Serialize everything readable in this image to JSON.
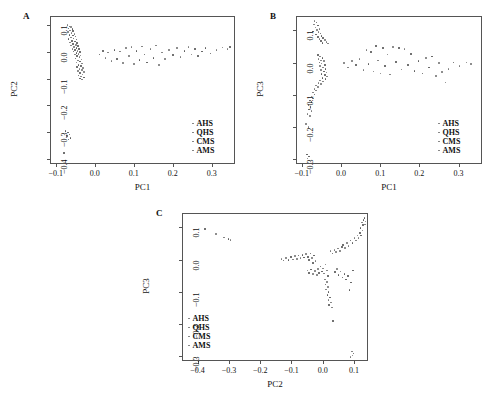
{
  "figure": {
    "background": "#ffffff",
    "point_color": "#777777",
    "frame_color": "#555555"
  },
  "legend_labels": [
    "AHS",
    "QHS",
    "CMS",
    "AMS"
  ],
  "panels": [
    {
      "letter": "A",
      "xlabel": "PC1",
      "ylabel": "PC2",
      "xticks": [
        "-0.1",
        "0.0",
        "0.1",
        "0.2",
        "0.3"
      ],
      "yticks": [
        "0.1",
        "0.0",
        "-0.1",
        "-0.2",
        "-0.3",
        "-0.4"
      ]
    },
    {
      "letter": "B",
      "xlabel": "PC1",
      "ylabel": "PC3",
      "xticks": [
        "-0.1",
        "0.0",
        "0.1",
        "0.2",
        "0.3"
      ],
      "yticks": [
        "0.1",
        "0.0",
        "-0.1",
        "-0.2",
        "-0.3"
      ]
    },
    {
      "letter": "C",
      "xlabel": "PC2",
      "ylabel": "PC3",
      "xticks": [
        "-0.4",
        "-0.3",
        "-0.2",
        "-0.1",
        "0.0",
        "0.1"
      ],
      "yticks": [
        "0.1",
        "0.0",
        "-0.1",
        "-0.2",
        "-0.3"
      ]
    }
  ],
  "chart_data": [
    {
      "type": "scatter",
      "panel": "A",
      "title": "",
      "xlabel": "PC1",
      "ylabel": "PC2",
      "xlim": [
        -0.115,
        0.36
      ],
      "ylim": [
        -0.42,
        0.135
      ],
      "xticks": [
        -0.1,
        0.0,
        0.1,
        0.2,
        0.3
      ],
      "yticks": [
        0.1,
        0.0,
        -0.1,
        -0.2,
        -0.3,
        -0.4
      ],
      "grid": false,
      "legend": [
        "AHS",
        "QHS",
        "CMS",
        "AMS"
      ],
      "legend_position": "lower-right",
      "points": [
        [
          -0.073,
          0.105
        ],
        [
          -0.068,
          0.1
        ],
        [
          -0.063,
          0.098
        ],
        [
          -0.07,
          0.092
        ],
        [
          -0.06,
          0.09
        ],
        [
          -0.066,
          0.085
        ],
        [
          -0.058,
          0.082
        ],
        [
          -0.072,
          0.078
        ],
        [
          -0.062,
          0.075
        ],
        [
          -0.055,
          0.072
        ],
        [
          -0.068,
          0.068
        ],
        [
          -0.059,
          0.065
        ],
        [
          -0.052,
          0.062
        ],
        [
          -0.064,
          0.058
        ],
        [
          -0.057,
          0.055
        ],
        [
          -0.07,
          0.052
        ],
        [
          -0.05,
          0.05
        ],
        [
          -0.061,
          0.046
        ],
        [
          -0.054,
          0.043
        ],
        [
          -0.066,
          0.04
        ],
        [
          -0.048,
          0.038
        ],
        [
          -0.058,
          0.034
        ],
        [
          -0.051,
          0.031
        ],
        [
          -0.063,
          0.028
        ],
        [
          -0.045,
          0.026
        ],
        [
          -0.056,
          0.022
        ],
        [
          -0.049,
          0.019
        ],
        [
          -0.06,
          0.016
        ],
        [
          -0.043,
          0.014
        ],
        [
          -0.053,
          0.011
        ],
        [
          -0.047,
          0.008
        ],
        [
          -0.057,
          0.005
        ],
        [
          -0.041,
          0.003
        ],
        [
          -0.05,
          0.0
        ],
        [
          -0.044,
          -0.003
        ],
        [
          -0.054,
          -0.006
        ],
        [
          -0.039,
          -0.009
        ],
        [
          -0.048,
          -0.012
        ],
        [
          -0.042,
          -0.016
        ],
        [
          -0.052,
          -0.02
        ],
        [
          -0.037,
          -0.024
        ],
        [
          -0.046,
          -0.028
        ],
        [
          -0.04,
          -0.032
        ],
        [
          -0.05,
          -0.036
        ],
        [
          -0.035,
          -0.04
        ],
        [
          -0.044,
          -0.044
        ],
        [
          -0.038,
          -0.048
        ],
        [
          -0.048,
          -0.052
        ],
        [
          -0.033,
          -0.056
        ],
        [
          -0.042,
          -0.06
        ],
        [
          -0.036,
          -0.064
        ],
        [
          -0.046,
          -0.068
        ],
        [
          -0.031,
          -0.072
        ],
        [
          -0.04,
          -0.076
        ],
        [
          -0.034,
          -0.08
        ],
        [
          -0.044,
          -0.084
        ],
        [
          -0.038,
          -0.088
        ],
        [
          -0.03,
          -0.092
        ],
        [
          -0.041,
          -0.096
        ],
        [
          -0.035,
          -0.099
        ],
        [
          0.01,
          -0.005
        ],
        [
          0.018,
          0.008
        ],
        [
          0.025,
          -0.018
        ],
        [
          0.032,
          0.002
        ],
        [
          0.04,
          -0.03
        ],
        [
          0.048,
          0.012
        ],
        [
          0.055,
          -0.022
        ],
        [
          0.062,
          0.005
        ],
        [
          0.07,
          -0.038
        ],
        [
          0.078,
          0.018
        ],
        [
          0.085,
          -0.012
        ],
        [
          0.092,
          0.022
        ],
        [
          0.098,
          -0.042
        ],
        [
          0.105,
          0.008
        ],
        [
          0.112,
          -0.026
        ],
        [
          0.118,
          0.025
        ],
        [
          0.125,
          -0.005
        ],
        [
          0.132,
          -0.035
        ],
        [
          0.14,
          0.015
        ],
        [
          0.148,
          -0.018
        ],
        [
          0.155,
          0.028
        ],
        [
          0.162,
          -0.045
        ],
        [
          0.17,
          0.002
        ],
        [
          0.178,
          -0.022
        ],
        [
          0.188,
          0.012
        ],
        [
          0.198,
          -0.008
        ],
        [
          0.208,
          0.018
        ],
        [
          0.218,
          -0.015
        ],
        [
          0.228,
          0.008
        ],
        [
          0.238,
          0.022
        ],
        [
          0.246,
          -0.005
        ],
        [
          0.254,
          0.015
        ],
        [
          0.262,
          -0.012
        ],
        [
          0.272,
          0.005
        ],
        [
          0.282,
          0.018
        ],
        [
          0.295,
          -0.002
        ],
        [
          0.31,
          0.012
        ],
        [
          0.325,
          0.02
        ],
        [
          0.338,
          0.015
        ],
        [
          0.345,
          0.022
        ],
        [
          -0.078,
          -0.292
        ],
        [
          -0.072,
          -0.298
        ],
        [
          -0.068,
          -0.305
        ],
        [
          -0.074,
          -0.312
        ],
        [
          -0.065,
          -0.318
        ],
        [
          -0.07,
          -0.325
        ],
        [
          -0.082,
          -0.375
        ]
      ]
    },
    {
      "type": "scatter",
      "panel": "B",
      "title": "",
      "xlabel": "PC1",
      "ylabel": "PC3",
      "xlim": [
        -0.115,
        0.36
      ],
      "ylim": [
        -0.315,
        0.145
      ],
      "xticks": [
        -0.1,
        0.0,
        0.1,
        0.2,
        0.3
      ],
      "yticks": [
        0.1,
        0.0,
        -0.1,
        -0.2,
        -0.3
      ],
      "grid": false,
      "legend": [
        "AHS",
        "QHS",
        "CMS",
        "AMS"
      ],
      "legend_position": "lower-right",
      "points": [
        [
          -0.07,
          0.132
        ],
        [
          -0.065,
          0.128
        ],
        [
          -0.072,
          0.122
        ],
        [
          -0.062,
          0.118
        ],
        [
          -0.068,
          0.112
        ],
        [
          -0.058,
          0.108
        ],
        [
          -0.064,
          0.104
        ],
        [
          -0.074,
          0.1
        ],
        [
          -0.06,
          0.098
        ],
        [
          -0.055,
          0.094
        ],
        [
          -0.066,
          0.09
        ],
        [
          -0.052,
          0.086
        ],
        [
          -0.062,
          0.082
        ],
        [
          -0.048,
          0.08
        ],
        [
          -0.058,
          0.076
        ],
        [
          -0.044,
          0.074
        ],
        [
          -0.054,
          0.07
        ],
        [
          -0.04,
          0.068
        ],
        [
          -0.05,
          0.064
        ],
        [
          -0.036,
          0.062
        ],
        [
          -0.062,
          0.026
        ],
        [
          -0.056,
          0.022
        ],
        [
          -0.05,
          0.018
        ],
        [
          -0.06,
          0.014
        ],
        [
          -0.054,
          0.01
        ],
        [
          -0.046,
          0.008
        ],
        [
          -0.058,
          0.004
        ],
        [
          -0.052,
          0.0
        ],
        [
          -0.044,
          -0.004
        ],
        [
          -0.056,
          -0.008
        ],
        [
          -0.048,
          -0.012
        ],
        [
          -0.042,
          -0.016
        ],
        [
          -0.054,
          -0.02
        ],
        [
          -0.046,
          -0.024
        ],
        [
          -0.04,
          -0.028
        ],
        [
          -0.052,
          -0.032
        ],
        [
          -0.044,
          -0.036
        ],
        [
          -0.038,
          -0.04
        ],
        [
          -0.05,
          -0.044
        ],
        [
          -0.042,
          -0.048
        ],
        [
          -0.056,
          -0.052
        ],
        [
          -0.048,
          -0.056
        ],
        [
          -0.06,
          -0.06
        ],
        [
          -0.054,
          -0.064
        ],
        [
          -0.066,
          -0.068
        ],
        [
          -0.062,
          -0.072
        ],
        [
          -0.07,
          -0.078
        ],
        [
          -0.066,
          -0.084
        ],
        [
          -0.074,
          -0.09
        ],
        [
          -0.07,
          -0.096
        ],
        [
          -0.078,
          -0.102
        ],
        [
          -0.074,
          -0.108
        ],
        [
          -0.082,
          -0.114
        ],
        [
          -0.078,
          -0.12
        ],
        [
          -0.086,
          -0.128
        ],
        [
          -0.08,
          -0.134
        ],
        [
          -0.084,
          -0.142
        ],
        [
          -0.078,
          -0.148
        ],
        [
          -0.088,
          -0.156
        ],
        [
          -0.082,
          -0.162
        ],
        [
          -0.092,
          -0.188
        ],
        [
          -0.086,
          -0.196
        ],
        [
          -0.09,
          -0.282
        ],
        [
          -0.084,
          -0.288
        ],
        [
          -0.088,
          -0.295
        ],
        [
          0.005,
          0.002
        ],
        [
          0.015,
          -0.012
        ],
        [
          0.025,
          0.008
        ],
        [
          0.035,
          -0.004
        ],
        [
          0.045,
          0.014
        ],
        [
          0.055,
          -0.02
        ],
        [
          0.062,
          0.042
        ],
        [
          0.068,
          -0.002
        ],
        [
          0.074,
          0.036
        ],
        [
          0.08,
          -0.024
        ],
        [
          0.086,
          0.055
        ],
        [
          0.092,
          0.01
        ],
        [
          0.098,
          -0.03
        ],
        [
          0.104,
          0.048
        ],
        [
          0.11,
          -0.008
        ],
        [
          0.116,
          0.028
        ],
        [
          0.122,
          -0.034
        ],
        [
          0.13,
          0.052
        ],
        [
          0.138,
          0.006
        ],
        [
          0.146,
          0.048
        ],
        [
          0.152,
          -0.018
        ],
        [
          0.16,
          0.045
        ],
        [
          0.168,
          -0.005
        ],
        [
          0.176,
          0.03
        ],
        [
          0.185,
          -0.022
        ],
        [
          0.195,
          0.008
        ],
        [
          0.205,
          -0.03
        ],
        [
          0.215,
          0.018
        ],
        [
          0.222,
          -0.012
        ],
        [
          0.23,
          0.022
        ],
        [
          0.24,
          -0.038
        ],
        [
          0.248,
          0.002
        ],
        [
          0.256,
          -0.026
        ],
        [
          0.264,
          -0.058
        ],
        [
          0.272,
          -0.016
        ],
        [
          0.285,
          0.004
        ],
        [
          0.3,
          -0.008
        ],
        [
          0.318,
          0.004
        ],
        [
          0.33,
          -0.002
        ]
      ]
    },
    {
      "type": "scatter",
      "panel": "C",
      "title": "",
      "xlabel": "PC2",
      "ylabel": "PC3",
      "xlim": [
        -0.45,
        0.145
      ],
      "ylim": [
        -0.315,
        0.145
      ],
      "xticks": [
        -0.4,
        -0.3,
        -0.2,
        -0.1,
        0.0,
        0.1
      ],
      "yticks": [
        0.1,
        0.0,
        -0.1,
        -0.2,
        -0.3
      ],
      "grid": false,
      "legend": [
        "AHS",
        "QHS",
        "CMS",
        "AMS"
      ],
      "legend_position": "lower-left",
      "points": [
        [
          -0.38,
          0.098
        ],
        [
          -0.345,
          0.082
        ],
        [
          -0.318,
          0.072
        ],
        [
          -0.305,
          0.068
        ],
        [
          -0.298,
          0.064
        ],
        [
          -0.135,
          0.005
        ],
        [
          -0.128,
          0.0
        ],
        [
          -0.12,
          0.008
        ],
        [
          -0.112,
          0.002
        ],
        [
          -0.105,
          0.012
        ],
        [
          -0.098,
          0.004
        ],
        [
          -0.092,
          0.014
        ],
        [
          -0.086,
          0.006
        ],
        [
          -0.08,
          0.016
        ],
        [
          -0.074,
          0.008
        ],
        [
          -0.068,
          0.018
        ],
        [
          -0.062,
          0.01
        ],
        [
          -0.056,
          0.02
        ],
        [
          -0.05,
          0.012
        ],
        [
          -0.046,
          0.002
        ],
        [
          -0.042,
          0.022
        ],
        [
          -0.038,
          0.008
        ],
        [
          -0.034,
          -0.008
        ],
        [
          -0.03,
          0.016
        ],
        [
          -0.026,
          -0.002
        ],
        [
          -0.052,
          -0.03
        ],
        [
          -0.046,
          -0.038
        ],
        [
          -0.04,
          -0.028
        ],
        [
          -0.034,
          -0.042
        ],
        [
          -0.028,
          -0.032
        ],
        [
          -0.022,
          -0.044
        ],
        [
          -0.018,
          -0.026
        ],
        [
          -0.014,
          -0.038
        ],
        [
          -0.01,
          -0.018
        ],
        [
          -0.006,
          -0.034
        ],
        [
          -0.002,
          -0.024
        ],
        [
          0.002,
          -0.04
        ],
        [
          0.006,
          -0.012
        ],
        [
          0.01,
          -0.03
        ],
        [
          0.014,
          -0.048
        ],
        [
          0.004,
          -0.058
        ],
        [
          0.01,
          -0.066
        ],
        [
          0.006,
          -0.074
        ],
        [
          0.014,
          -0.082
        ],
        [
          0.008,
          -0.09
        ],
        [
          0.016,
          -0.098
        ],
        [
          0.012,
          -0.106
        ],
        [
          0.02,
          -0.114
        ],
        [
          0.016,
          -0.122
        ],
        [
          0.024,
          -0.13
        ],
        [
          0.018,
          -0.138
        ],
        [
          0.026,
          -0.146
        ],
        [
          0.03,
          -0.188
        ],
        [
          0.022,
          0.03
        ],
        [
          0.028,
          0.022
        ],
        [
          0.034,
          0.034
        ],
        [
          0.04,
          0.026
        ],
        [
          0.046,
          0.038
        ],
        [
          0.052,
          0.03
        ],
        [
          0.058,
          0.042
        ],
        [
          0.036,
          -0.036
        ],
        [
          0.042,
          -0.026
        ],
        [
          0.048,
          -0.044
        ],
        [
          0.054,
          -0.034
        ],
        [
          0.06,
          -0.052
        ],
        [
          0.066,
          -0.042
        ],
        [
          0.072,
          -0.058
        ],
        [
          0.078,
          -0.048
        ],
        [
          0.062,
          0.048
        ],
        [
          0.068,
          0.04
        ],
        [
          0.074,
          0.055
        ],
        [
          0.08,
          0.046
        ],
        [
          0.086,
          0.062
        ],
        [
          0.092,
          0.054
        ],
        [
          0.098,
          0.07
        ],
        [
          0.104,
          0.062
        ],
        [
          0.108,
          0.078
        ],
        [
          0.112,
          0.07
        ],
        [
          0.116,
          0.086
        ],
        [
          0.12,
          0.078
        ],
        [
          0.124,
          0.094
        ],
        [
          0.118,
          0.102
        ],
        [
          0.126,
          0.11
        ],
        [
          0.122,
          0.118
        ],
        [
          0.128,
          0.126
        ],
        [
          0.132,
          0.112
        ],
        [
          0.134,
          0.122
        ],
        [
          0.13,
          0.132
        ],
        [
          0.09,
          -0.282
        ],
        [
          0.096,
          -0.288
        ],
        [
          0.092,
          -0.295
        ],
        [
          0.086,
          -0.3
        ],
        [
          0.082,
          -0.092
        ],
        [
          0.088,
          -0.068
        ],
        [
          0.094,
          -0.03
        ]
      ]
    }
  ]
}
